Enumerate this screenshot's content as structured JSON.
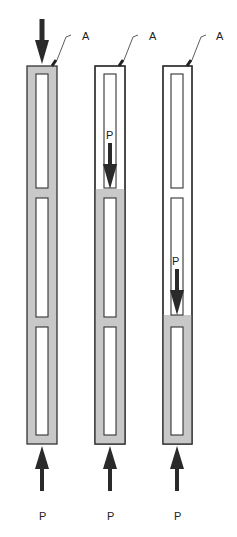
{
  "colors": {
    "loaded": "#c8c8c8",
    "outline": "#333333",
    "arrow": "#2a2a2a",
    "background": "#ffffff"
  },
  "columns": [
    {
      "id": "column-1",
      "x": 27,
      "loaded_from_y": 66,
      "top_label": "A",
      "bottom_label": "P",
      "top_arrow": true,
      "internal_load_label": ""
    },
    {
      "id": "column-2",
      "x": 95,
      "loaded_from_y": 189,
      "top_label": "A",
      "bottom_label": "P",
      "top_arrow": false,
      "internal_load_label": "P"
    },
    {
      "id": "column-3",
      "x": 163,
      "loaded_from_y": 315,
      "top_label": "A",
      "bottom_label": "P",
      "top_arrow": false,
      "internal_load_label": "P"
    }
  ],
  "labels": {
    "a1": "A",
    "a2": "A",
    "a3": "A",
    "p_bottom1": "P",
    "p_bottom2": "P",
    "p_bottom3": "P",
    "p_internal2": "P",
    "p_internal3": "P"
  }
}
